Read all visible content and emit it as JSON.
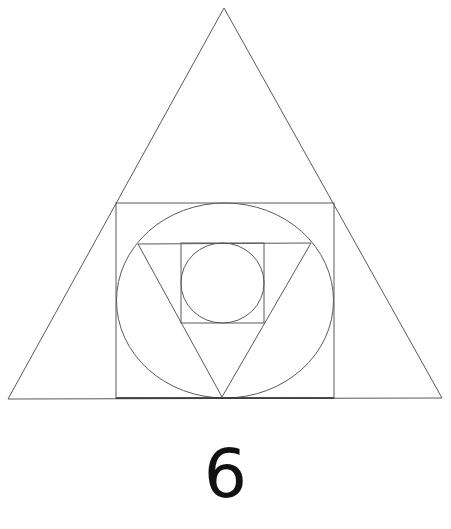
{
  "figure": {
    "label": "6",
    "colors": {
      "background": "#ffffff",
      "line": "#5a5a5a",
      "base_line": "#333333",
      "label": "#111111"
    },
    "shapes": {
      "outer_triangle": {
        "points": [
          [
            224,
            8
          ],
          [
            8,
            399
          ],
          [
            442,
            398
          ]
        ]
      },
      "outer_square": {
        "x": 116,
        "y": 203,
        "width": 218,
        "height": 195
      },
      "outer_ellipse": {
        "cx": 225,
        "cy": 300.5,
        "rx": 108.5,
        "ry": 97.5
      },
      "inner_triangle": {
        "points": [
          [
            138,
            244
          ],
          [
            311,
            243
          ],
          [
            222,
            397
          ]
        ]
      },
      "inner_square": {
        "x": 181,
        "y": 243,
        "width": 83,
        "height": 80
      },
      "inner_circle": {
        "cx": 222.5,
        "cy": 283,
        "rx": 41.5,
        "ry": 40
      }
    }
  }
}
